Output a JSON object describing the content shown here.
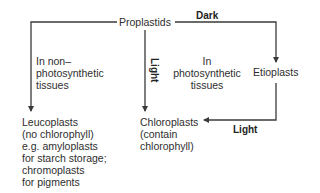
{
  "diagram": {
    "nodes": {
      "proplastids": "Proplastids",
      "etioplasts": "Etioplasts",
      "leucoplasts": {
        "lines": [
          "Leucoplasts",
          "(no chlorophyll)",
          "e.g. amyloplasts",
          "for starch storage;",
          "chromoplasts",
          "for pigments"
        ]
      },
      "chloroplasts": {
        "lines": [
          "Chloroplasts",
          "(contain",
          "chlorophyll)"
        ]
      }
    },
    "annotations": {
      "non_photosynthetic": [
        "In non–",
        "photosynthetic",
        "tissues"
      ],
      "photosynthetic": [
        "In",
        "photosynthetic",
        "tissues"
      ]
    },
    "edge_labels": {
      "dark": "Dark",
      "light_vertical": "Light",
      "light_bottom": "Light"
    },
    "edges": [
      {
        "from": "Proplastids",
        "to": "Leucoplasts",
        "label": ""
      },
      {
        "from": "Proplastids",
        "to": "Chloroplasts",
        "label": "Light"
      },
      {
        "from": "Proplastids",
        "to": "Etioplasts",
        "label": "Dark"
      },
      {
        "from": "Etioplasts",
        "to": "Chloroplasts",
        "label": "Light"
      }
    ],
    "colors": {
      "line": "#3a3a3a",
      "text": "#2e2e2e"
    }
  }
}
